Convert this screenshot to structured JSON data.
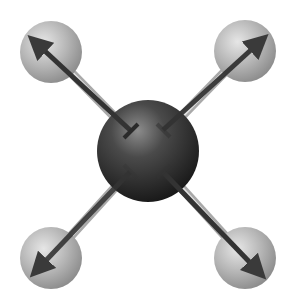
{
  "diagram": {
    "central_atom": {
      "label": "",
      "cx": 148,
      "cy": 151,
      "r": 51,
      "color": "#2e2e2e"
    },
    "outer_atoms": [
      {
        "id": "top-left",
        "cx": 51,
        "cy": 52,
        "r": 31,
        "color": "#b8b8b8"
      },
      {
        "id": "top-right",
        "cx": 245,
        "cy": 51,
        "r": 31,
        "color": "#b8b8b8"
      },
      {
        "id": "bottom-left",
        "cx": 51,
        "cy": 258,
        "r": 31,
        "color": "#b8b8b8"
      },
      {
        "id": "bottom-right",
        "cx": 245,
        "cy": 258,
        "r": 31,
        "color": "#b8b8b8"
      }
    ],
    "dipole_arrows": [
      {
        "id": "top-left",
        "from": [
          130,
          130
        ],
        "to": [
          28,
          35
        ]
      },
      {
        "id": "top-right",
        "from": [
          163,
          130
        ],
        "to": [
          268,
          34
        ]
      },
      {
        "id": "bottom-left",
        "from": [
          130,
          172
        ],
        "to": [
          30,
          277
        ]
      },
      {
        "id": "bottom-right",
        "from": [
          163,
          172
        ],
        "to": [
          266,
          279
        ]
      }
    ],
    "colors": {
      "bond": "#d4d4d4",
      "arrow": "#3a3a3a",
      "background": "#ffffff"
    }
  }
}
